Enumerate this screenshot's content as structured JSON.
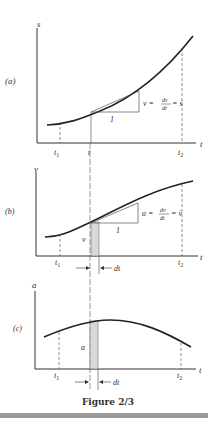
{
  "figure": {
    "caption": "Figure 2/3",
    "panels": [
      {
        "id": "a",
        "panel_label": "(a)",
        "y_axis_label": "s",
        "x_axis_label": "t",
        "tick_labels": [
          "t1",
          "t",
          "t2"
        ],
        "slope_run_label": "1",
        "equation": "v = ds/dt = ṡ",
        "equation_parts": {
          "lhs": "v =",
          "num": "ds",
          "den": "dt",
          "rhs": "= ṡ"
        }
      },
      {
        "id": "b",
        "panel_label": "(b)",
        "y_axis_label": "v",
        "x_axis_label": "t",
        "tick_labels": [
          "t1",
          "t2"
        ],
        "slope_run_label": "1",
        "strip_label": "v",
        "interval_label": "dt",
        "equation": "a = dv/dt = v̇",
        "equation_parts": {
          "lhs": "a =",
          "num": "dv",
          "den": "dt",
          "rhs": "= v̇"
        }
      },
      {
        "id": "c",
        "panel_label": "(c)",
        "y_axis_label": "a",
        "x_axis_label": "t",
        "tick_labels": [
          "t1",
          "t2"
        ],
        "strip_label": "a",
        "interval_label": "dt"
      }
    ],
    "colors": {
      "curve": "#222222",
      "axis": "#333333",
      "strip_fill": "#d9d9d9",
      "rule_bar": "#9a9a9a"
    }
  }
}
